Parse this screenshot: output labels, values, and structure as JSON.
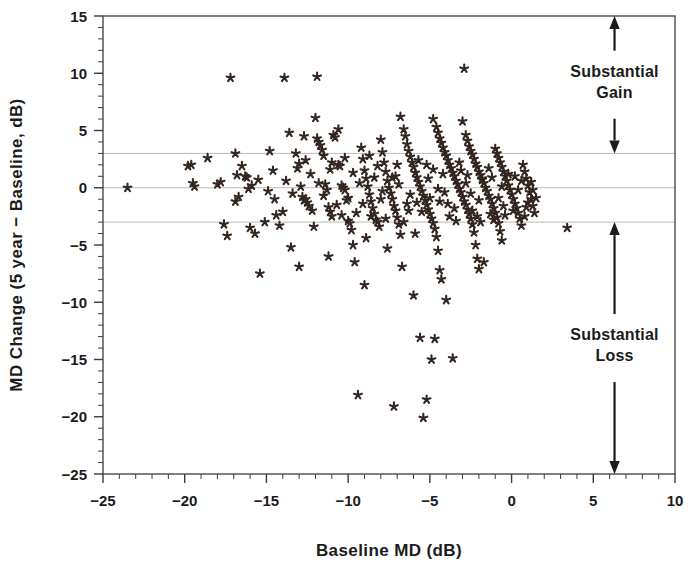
{
  "chart_data": {
    "type": "scatter",
    "title": "",
    "xlabel": "Baseline MD (dB)",
    "ylabel": "MD Change (5 year − Baseline, dB)",
    "xlim": [
      -25,
      10
    ],
    "ylim": [
      -25,
      15
    ],
    "xticks": [
      -25,
      -20,
      -15,
      -10,
      -5,
      0,
      5,
      10
    ],
    "xticklabels": [
      "−25",
      "−20",
      "−15",
      "−10",
      "−5",
      "0",
      "5",
      "10"
    ],
    "yticks": [
      15,
      10,
      5,
      0,
      -5,
      -10,
      -15,
      -20,
      -25
    ],
    "yticklabels": [
      "15",
      "10",
      "5",
      "0",
      "−5",
      "−10",
      "−15",
      "−20",
      "−25"
    ],
    "minor_tick_interval": 1,
    "grid": false,
    "marker": "asterisk",
    "marker_color": "#332620",
    "reference_lines": [
      {
        "y": 3,
        "label": "upper substantial-change threshold",
        "color": "#b9b9b9"
      },
      {
        "y": 0,
        "label": "no change",
        "color": "#b9b9b9"
      },
      {
        "y": -3,
        "label": "lower substantial-change threshold",
        "color": "#b9b9b9"
      }
    ],
    "annotations": [
      {
        "text": "Substantial\nGain",
        "line1": "Substantial",
        "line2": "Gain",
        "x": 6.3,
        "y_from": 15,
        "y_to": 3,
        "arrow": "double"
      },
      {
        "text": "Substantial\nLoss",
        "line1": "Substantial",
        "line2": "Loss",
        "x": 6.3,
        "y_from": -3,
        "y_to": -25,
        "arrow": "double"
      }
    ],
    "points": [
      [
        -23.5,
        0.0
      ],
      [
        -19.8,
        1.9
      ],
      [
        -19.6,
        2.0
      ],
      [
        -19.5,
        0.4
      ],
      [
        -19.4,
        0.1
      ],
      [
        -18.6,
        2.6
      ],
      [
        -17.2,
        9.6
      ],
      [
        -17.6,
        -3.2
      ],
      [
        -17.4,
        -4.2
      ],
      [
        -16.9,
        3.0
      ],
      [
        -16.9,
        -1.2
      ],
      [
        -16.5,
        1.9
      ],
      [
        -16.3,
        1.0
      ],
      [
        -16.2,
        0.9
      ],
      [
        -16.1,
        -0.1
      ],
      [
        -16.0,
        -3.5
      ],
      [
        -15.7,
        -4.0
      ],
      [
        -15.4,
        -7.5
      ],
      [
        -14.8,
        3.2
      ],
      [
        -14.6,
        1.5
      ],
      [
        -14.4,
        -2.4
      ],
      [
        -14.2,
        -3.3
      ],
      [
        -13.9,
        9.6
      ],
      [
        -13.6,
        4.8
      ],
      [
        -13.5,
        -5.2
      ],
      [
        -13.2,
        3.0
      ],
      [
        -13.1,
        1.7
      ],
      [
        -12.9,
        0.1
      ],
      [
        -12.8,
        -0.8
      ],
      [
        -12.7,
        -1.1
      ],
      [
        -12.6,
        -1.0
      ],
      [
        -12.5,
        -1.3
      ],
      [
        -12.1,
        -3.4
      ],
      [
        -12.0,
        6.1
      ],
      [
        -11.9,
        4.3
      ],
      [
        -11.8,
        4.0
      ],
      [
        -11.7,
        3.7
      ],
      [
        -11.6,
        3.3
      ],
      [
        -11.5,
        2.8
      ],
      [
        -11.4,
        0.3
      ],
      [
        -11.3,
        -0.2
      ],
      [
        -11.2,
        -1.7
      ],
      [
        -11.1,
        -2.1
      ],
      [
        -11.0,
        -2.5
      ],
      [
        -11.9,
        9.7
      ],
      [
        -10.9,
        4.6
      ],
      [
        -10.8,
        4.4
      ],
      [
        -10.6,
        2.0
      ],
      [
        -10.5,
        1.9
      ],
      [
        -10.4,
        0.2
      ],
      [
        -10.3,
        0.0
      ],
      [
        -10.2,
        -0.2
      ],
      [
        -10.1,
        -1.1
      ],
      [
        -10.0,
        -2.9
      ],
      [
        -9.9,
        -3.1
      ],
      [
        -9.8,
        -3.7
      ],
      [
        -9.7,
        -5.0
      ],
      [
        -9.6,
        -6.5
      ],
      [
        -9.4,
        -18.1
      ],
      [
        -9.2,
        3.5
      ],
      [
        -9.1,
        2.5
      ],
      [
        -9.0,
        1.5
      ],
      [
        -8.9,
        0.8
      ],
      [
        -8.8,
        0.1
      ],
      [
        -8.7,
        -0.6
      ],
      [
        -8.6,
        -1.2
      ],
      [
        -8.5,
        -1.8
      ],
      [
        -8.4,
        -2.3
      ],
      [
        -8.3,
        -2.8
      ],
      [
        -8.2,
        -3.0
      ],
      [
        -8.1,
        -3.4
      ],
      [
        -8.0,
        4.2
      ],
      [
        -7.9,
        3.1
      ],
      [
        -7.8,
        2.2
      ],
      [
        -7.7,
        1.4
      ],
      [
        -7.6,
        0.6
      ],
      [
        -7.5,
        0.0
      ],
      [
        -7.4,
        -0.5
      ],
      [
        -7.3,
        -1.0
      ],
      [
        -7.2,
        -1.6
      ],
      [
        -7.1,
        -2.0
      ],
      [
        -7.0,
        -2.6
      ],
      [
        -6.9,
        -3.2
      ],
      [
        -6.8,
        -4.1
      ],
      [
        -6.7,
        -6.9
      ],
      [
        -7.2,
        -19.1
      ],
      [
        -6.6,
        5.1
      ],
      [
        -6.5,
        4.5
      ],
      [
        -6.4,
        3.8
      ],
      [
        -6.3,
        3.2
      ],
      [
        -6.2,
        2.7
      ],
      [
        -6.1,
        2.2
      ],
      [
        -6.0,
        1.8
      ],
      [
        -5.9,
        1.3
      ],
      [
        -5.8,
        0.9
      ],
      [
        -5.7,
        0.5
      ],
      [
        -5.6,
        0.1
      ],
      [
        -5.5,
        -0.3
      ],
      [
        -5.4,
        -0.7
      ],
      [
        -5.3,
        -1.1
      ],
      [
        -5.2,
        -1.5
      ],
      [
        -5.1,
        -1.9
      ],
      [
        -5.0,
        -2.3
      ],
      [
        -4.9,
        -2.7
      ],
      [
        -4.8,
        -3.1
      ],
      [
        -4.7,
        -3.6
      ],
      [
        -4.6,
        -4.3
      ],
      [
        -4.5,
        -5.5
      ],
      [
        -4.4,
        -7.2
      ],
      [
        -4.3,
        -8.0
      ],
      [
        -5.6,
        -13.1
      ],
      [
        -5.4,
        -20.1
      ],
      [
        -5.2,
        -18.5
      ],
      [
        -4.9,
        -15.0
      ],
      [
        -4.7,
        -13.2
      ],
      [
        -4.6,
        5.3
      ],
      [
        -4.5,
        4.8
      ],
      [
        -4.4,
        4.3
      ],
      [
        -4.3,
        3.9
      ],
      [
        -4.2,
        3.5
      ],
      [
        -4.1,
        3.1
      ],
      [
        -4.0,
        2.8
      ],
      [
        -3.9,
        2.4
      ],
      [
        -3.8,
        2.0
      ],
      [
        -3.7,
        1.7
      ],
      [
        -3.6,
        1.3
      ],
      [
        -3.5,
        1.0
      ],
      [
        -3.4,
        0.6
      ],
      [
        -3.3,
        0.3
      ],
      [
        -3.2,
        -0.1
      ],
      [
        -3.1,
        -0.4
      ],
      [
        -3.0,
        -0.8
      ],
      [
        -2.9,
        -1.2
      ],
      [
        -2.8,
        -1.5
      ],
      [
        -2.7,
        -1.9
      ],
      [
        -2.6,
        -2.3
      ],
      [
        -2.5,
        -2.7
      ],
      [
        -2.4,
        -3.2
      ],
      [
        -2.3,
        -3.9
      ],
      [
        -2.2,
        -5.0
      ],
      [
        -2.1,
        -6.2
      ],
      [
        -2.0,
        -7.1
      ],
      [
        -3.6,
        -14.9
      ],
      [
        -2.9,
        10.4
      ],
      [
        -2.8,
        4.6
      ],
      [
        -2.7,
        4.1
      ],
      [
        -2.6,
        3.6
      ],
      [
        -2.5,
        3.2
      ],
      [
        -2.4,
        2.9
      ],
      [
        -2.3,
        2.5
      ],
      [
        -2.2,
        2.1
      ],
      [
        -2.1,
        1.8
      ],
      [
        -2.0,
        1.4
      ],
      [
        -1.9,
        1.1
      ],
      [
        -1.8,
        0.7
      ],
      [
        -1.7,
        0.4
      ],
      [
        -1.6,
        0.0
      ],
      [
        -1.5,
        -0.3
      ],
      [
        -1.4,
        -0.7
      ],
      [
        -1.3,
        -1.0
      ],
      [
        -1.2,
        -1.4
      ],
      [
        -1.1,
        -1.8
      ],
      [
        -1.0,
        -2.2
      ],
      [
        -0.9,
        -2.6
      ],
      [
        -0.8,
        -3.1
      ],
      [
        -0.7,
        -3.8
      ],
      [
        -0.6,
        -4.6
      ],
      [
        -1.7,
        -6.5
      ],
      [
        -1.0,
        3.4
      ],
      [
        -0.9,
        3.0
      ],
      [
        -0.8,
        2.6
      ],
      [
        -0.7,
        2.2
      ],
      [
        -0.6,
        1.8
      ],
      [
        -0.5,
        1.4
      ],
      [
        -0.4,
        1.0
      ],
      [
        -0.3,
        0.6
      ],
      [
        -0.2,
        0.2
      ],
      [
        -0.1,
        -0.2
      ],
      [
        0.0,
        -0.6
      ],
      [
        0.1,
        -1.0
      ],
      [
        0.2,
        -1.4
      ],
      [
        0.3,
        -1.8
      ],
      [
        0.4,
        -2.2
      ],
      [
        0.5,
        -2.7
      ],
      [
        0.6,
        -3.3
      ],
      [
        0.7,
        2.0
      ],
      [
        0.8,
        1.4
      ],
      [
        0.9,
        0.8
      ],
      [
        1.0,
        0.2
      ],
      [
        1.1,
        -0.4
      ],
      [
        1.2,
        -1.0
      ],
      [
        1.3,
        -1.6
      ],
      [
        1.4,
        -2.2
      ],
      [
        1.5,
        -0.9
      ],
      [
        3.4,
        -3.5
      ],
      [
        -18.0,
        0.3
      ],
      [
        -17.8,
        0.5
      ],
      [
        -16.8,
        1.1
      ],
      [
        -15.9,
        0.2
      ],
      [
        -15.1,
        -3.0
      ],
      [
        -14.0,
        -2.1
      ],
      [
        -13.4,
        -0.5
      ],
      [
        -12.3,
        1.2
      ],
      [
        -11.1,
        1.6
      ],
      [
        -10.7,
        -1.5
      ],
      [
        -9.3,
        0.4
      ],
      [
        -8.9,
        -4.4
      ],
      [
        -8.2,
        1.9
      ],
      [
        -7.6,
        -5.3
      ],
      [
        -6.9,
        0.3
      ],
      [
        -6.3,
        -2.0
      ],
      [
        -5.9,
        -4.0
      ],
      [
        -5.1,
        0.8
      ],
      [
        -4.4,
        -1.2
      ],
      [
        -3.8,
        -2.5
      ],
      [
        -3.1,
        1.5
      ],
      [
        -2.5,
        -0.5
      ],
      [
        -1.9,
        -3.0
      ],
      [
        -1.2,
        0.9
      ],
      [
        -0.5,
        -1.6
      ],
      [
        -12.6,
        2.4
      ],
      [
        -11.5,
        -0.7
      ],
      [
        -10.2,
        2.6
      ],
      [
        -9.5,
        -2.2
      ],
      [
        -8.7,
        2.8
      ],
      [
        -7.9,
        -0.3
      ],
      [
        -7.1,
        1.0
      ],
      [
        -6.4,
        -1.4
      ],
      [
        -5.7,
        2.4
      ],
      [
        -5.0,
        -0.9
      ],
      [
        -4.2,
        1.2
      ],
      [
        -3.5,
        -1.8
      ],
      [
        -2.8,
        0.4
      ],
      [
        -2.1,
        -2.5
      ],
      [
        -1.4,
        1.7
      ],
      [
        -0.8,
        -0.9
      ],
      [
        -0.2,
        1.2
      ],
      [
        0.4,
        -0.2
      ],
      [
        0.9,
        -1.7
      ],
      [
        1.2,
        0.5
      ],
      [
        -13.8,
        0.6
      ],
      [
        -12.2,
        -2.0
      ],
      [
        -11.0,
        2.2
      ],
      [
        -10.0,
        -0.9
      ],
      [
        -9.1,
        -1.4
      ],
      [
        -8.4,
        0.9
      ],
      [
        -7.7,
        -2.7
      ],
      [
        -7.0,
        2.0
      ],
      [
        -6.2,
        -0.6
      ],
      [
        -5.5,
        -2.1
      ],
      [
        -4.8,
        1.6
      ],
      [
        -4.1,
        -0.4
      ],
      [
        -3.4,
        -2.9
      ],
      [
        -2.7,
        1.1
      ],
      [
        -2.0,
        -1.1
      ],
      [
        -1.3,
        -2.3
      ],
      [
        -0.6,
        0.1
      ],
      [
        0.1,
        -2.0
      ],
      [
        0.6,
        0.6
      ],
      [
        1.0,
        -1.3
      ],
      [
        -16.7,
        -0.8
      ],
      [
        -15.5,
        0.7
      ],
      [
        -14.5,
        -1.0
      ],
      [
        -13.0,
        2.1
      ],
      [
        -12.4,
        -1.6
      ],
      [
        -11.8,
        0.4
      ],
      [
        -10.4,
        -2.4
      ],
      [
        -9.7,
        1.3
      ],
      [
        -8.6,
        -2.5
      ],
      [
        -8.0,
        -1.0
      ],
      [
        -7.3,
        0.9
      ],
      [
        -6.6,
        -3.0
      ],
      [
        -5.8,
        -1.3
      ],
      [
        -5.2,
        2.0
      ],
      [
        -4.5,
        -0.1
      ],
      [
        -3.9,
        -1.4
      ],
      [
        -3.2,
        2.2
      ],
      [
        -2.4,
        -2.0
      ],
      [
        -1.8,
        0.8
      ],
      [
        -1.1,
        -2.8
      ],
      [
        -0.4,
        -2.4
      ],
      [
        0.2,
        1.0
      ],
      [
        0.8,
        -2.5
      ],
      [
        1.3,
        -0.2
      ],
      [
        -6.0,
        -9.4
      ],
      [
        -4.0,
        -9.8
      ],
      [
        -9.0,
        -8.5
      ],
      [
        -11.2,
        -6.0
      ],
      [
        -13.0,
        -6.9
      ],
      [
        -14.9,
        -0.3
      ],
      [
        -10.6,
        5.1
      ],
      [
        -12.7,
        4.5
      ],
      [
        -6.8,
        6.2
      ],
      [
        -3.0,
        5.8
      ],
      [
        -4.8,
        6.0
      ]
    ]
  },
  "axes": {
    "x_tick_count_minor": 35,
    "y_tick_count_minor": 40
  }
}
